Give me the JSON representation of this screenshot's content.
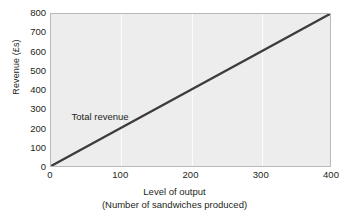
{
  "chart_data": {
    "type": "line",
    "title": "",
    "xlabel": "Level of output",
    "xlabel_sub": "(Number of sandwiches produced)",
    "ylabel": "Revenue (£s)",
    "xlim": [
      0,
      400
    ],
    "ylim": [
      0,
      800
    ],
    "x_ticks": [
      0,
      100,
      200,
      300,
      400
    ],
    "x_tick_labels": [
      "0",
      "100",
      "200",
      "300",
      "400"
    ],
    "y_ticks": [
      0,
      100,
      200,
      300,
      400,
      500,
      600,
      700,
      800
    ],
    "y_tick_labels": [
      "0",
      "100",
      "200",
      "300",
      "400",
      "500",
      "600",
      "700",
      "800"
    ],
    "grid": "vertical-only",
    "legend": "inline-annotation",
    "series": [
      {
        "name": "Total revenue",
        "color": "#3c3c3c",
        "x": [
          0,
          100,
          200,
          300,
          400
        ],
        "values": [
          0,
          200,
          400,
          600,
          800
        ],
        "annotation": {
          "text": "Total revenue",
          "x": 25,
          "y": 265
        }
      }
    ],
    "colors": {
      "plot_background": "#ededee",
      "figure_background": "#ffffff",
      "gridline": "#fbfbfb",
      "axis_border": "#b9b9bb",
      "text": "#231f20",
      "line": "#3c3c3c"
    }
  }
}
